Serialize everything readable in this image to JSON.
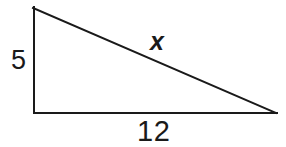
{
  "figure": {
    "name": "right-triangle-diagram",
    "background_color": "#ffffff",
    "stroke_color": "#1a1a1a",
    "stroke_width": 2,
    "text_color": "#1a1a1a",
    "vertices": {
      "top_left": [
        34,
        7
      ],
      "bottom_left": [
        34,
        113
      ],
      "bottom_right": [
        276,
        113
      ]
    },
    "labels": {
      "vertical_leg": "5",
      "hypotenuse": "x",
      "base": "12"
    },
    "sides": [
      {
        "name": "vertical-leg",
        "label": "5",
        "from": [
          34,
          7
        ],
        "to": [
          34,
          113
        ]
      },
      {
        "name": "hypotenuse",
        "label": "x",
        "from": [
          34,
          7
        ],
        "to": [
          276,
          113
        ]
      },
      {
        "name": "base",
        "label": "12",
        "from": [
          34,
          113
        ],
        "to": [
          276,
          113
        ]
      }
    ]
  }
}
